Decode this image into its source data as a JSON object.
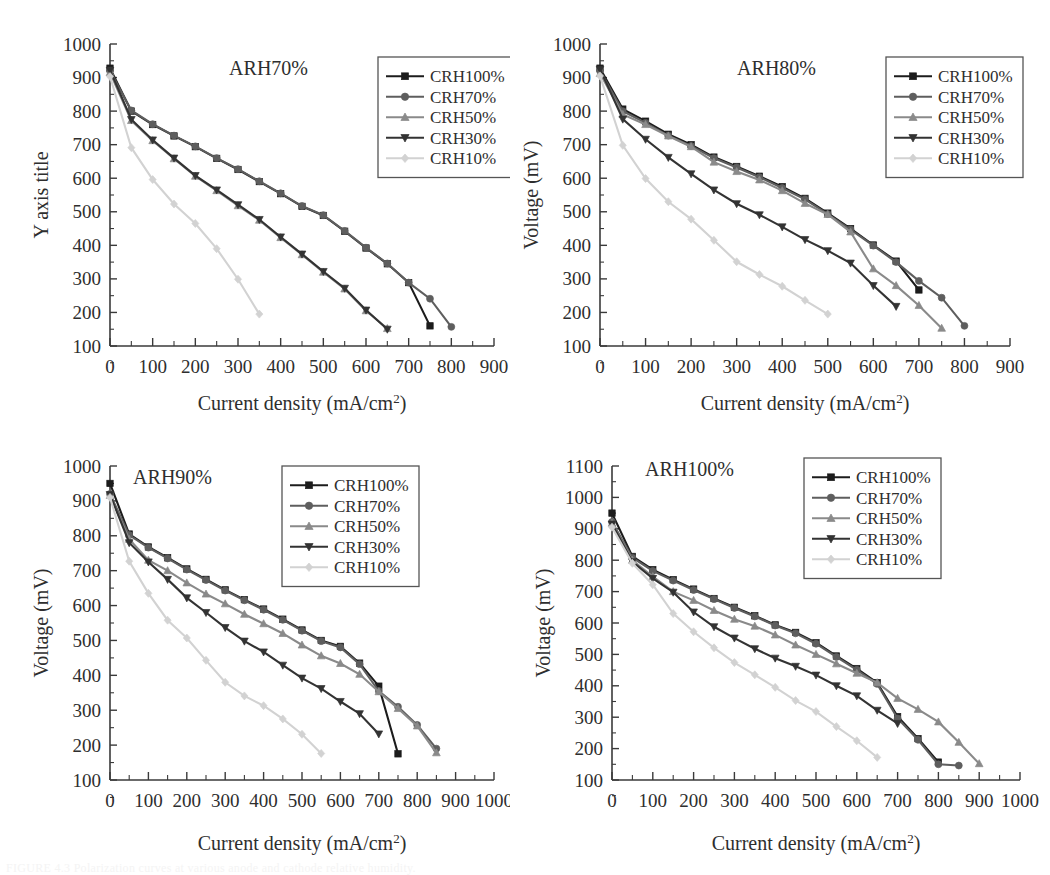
{
  "figure": {
    "panel_count": 4,
    "series_names": [
      "CRH100%",
      "CRH70%",
      "CRH50%",
      "CRH30%",
      "CRH10%"
    ],
    "series_colors": [
      "#1c1c1c",
      "#5e5e5e",
      "#8a8a8a",
      "#333333",
      "#d2d2d2"
    ],
    "series_markers": [
      "square",
      "circle",
      "triangle-up",
      "triangle-down",
      "diamond"
    ],
    "xlabel": "Current density (mA/cm",
    "xlabel_sup": "2",
    "xlabel_tail": ")",
    "caption": "FIGURE 4.3  Polarization curves at various anode and cathode relative humidity."
  },
  "chart_data": [
    {
      "id": "arh70",
      "type": "line",
      "title": "ARH70%",
      "xlabel": "Current density (mA/cm2)",
      "ylabel": "Y axis title",
      "xlim": [
        0,
        900
      ],
      "ylim": [
        100,
        1000
      ],
      "xticks": [
        0,
        100,
        200,
        300,
        400,
        500,
        600,
        700,
        800,
        900
      ],
      "yticks": [
        100,
        200,
        300,
        400,
        500,
        600,
        700,
        800,
        900,
        1000
      ],
      "grid": false,
      "legend_position": "top-right",
      "series": [
        {
          "name": "CRH100%",
          "x": [
            0,
            50,
            100,
            150,
            200,
            250,
            300,
            350,
            400,
            450,
            500,
            550,
            600,
            650,
            700,
            750
          ],
          "y": [
            928,
            800,
            760,
            726,
            694,
            659,
            626,
            590,
            554,
            516,
            489,
            442,
            392,
            345,
            289,
            160
          ]
        },
        {
          "name": "CRH70%",
          "x": [
            0,
            50,
            100,
            150,
            200,
            250,
            300,
            350,
            400,
            450,
            500,
            550,
            600,
            650,
            700,
            750,
            800
          ],
          "y": [
            920,
            802,
            761,
            727,
            695,
            660,
            627,
            591,
            555,
            517,
            490,
            443,
            393,
            346,
            289,
            241,
            157
          ]
        },
        {
          "name": "CRH50%",
          "x": [
            0,
            50,
            100,
            150,
            200,
            250,
            300,
            350,
            400,
            450,
            500,
            550,
            600,
            650
          ],
          "y": [
            915,
            772,
            712,
            658,
            606,
            563,
            518,
            475,
            423,
            372,
            320,
            270,
            205,
            152
          ]
        },
        {
          "name": "CRH30%",
          "x": [
            0,
            50,
            100,
            150,
            200,
            250,
            300,
            350,
            400,
            450,
            500,
            550,
            600,
            650
          ],
          "y": [
            922,
            775,
            714,
            660,
            608,
            565,
            521,
            477,
            425,
            374,
            322,
            272,
            207,
            150
          ]
        },
        {
          "name": "CRH10%",
          "x": [
            0,
            50,
            100,
            150,
            200,
            250,
            300,
            350
          ],
          "y": [
            903,
            691,
            596,
            523,
            465,
            390,
            299,
            195
          ]
        }
      ]
    },
    {
      "id": "arh80",
      "type": "line",
      "title": "ARH80%",
      "xlabel": "Current density (mA/cm2)",
      "ylabel": "Voltage (mV)",
      "xlim": [
        0,
        900
      ],
      "ylim": [
        100,
        1000
      ],
      "xticks": [
        0,
        100,
        200,
        300,
        400,
        500,
        600,
        700,
        800,
        900
      ],
      "yticks": [
        100,
        200,
        300,
        400,
        500,
        600,
        700,
        800,
        900,
        1000
      ],
      "grid": false,
      "legend_position": "top-right",
      "series": [
        {
          "name": "CRH100%",
          "x": [
            0,
            50,
            100,
            150,
            200,
            250,
            300,
            350,
            400,
            450,
            500,
            550,
            600,
            650,
            700
          ],
          "y": [
            928,
            806,
            770,
            731,
            700,
            663,
            635,
            606,
            575,
            540,
            496,
            450,
            401,
            353,
            267
          ]
        },
        {
          "name": "CRH70%",
          "x": [
            0,
            50,
            100,
            150,
            200,
            250,
            300,
            350,
            400,
            450,
            500,
            550,
            600,
            650,
            700,
            750,
            800
          ],
          "y": [
            920,
            800,
            765,
            727,
            696,
            660,
            632,
            603,
            571,
            537,
            493,
            447,
            399,
            350,
            294,
            244,
            160
          ]
        },
        {
          "name": "CRH50%",
          "x": [
            0,
            50,
            100,
            150,
            200,
            250,
            300,
            350,
            400,
            450,
            500,
            550,
            600,
            650,
            700,
            750
          ],
          "y": [
            912,
            790,
            760,
            726,
            694,
            648,
            620,
            595,
            563,
            525,
            492,
            440,
            330,
            280,
            221,
            153
          ]
        },
        {
          "name": "CRH30%",
          "x": [
            0,
            50,
            100,
            150,
            200,
            250,
            300,
            350,
            400,
            450,
            500,
            550,
            600,
            650
          ],
          "y": [
            925,
            776,
            716,
            662,
            613,
            565,
            524,
            491,
            455,
            417,
            384,
            347,
            280,
            218
          ]
        },
        {
          "name": "CRH10%",
          "x": [
            0,
            50,
            100,
            150,
            200,
            250,
            300,
            350,
            400,
            450,
            500
          ],
          "y": [
            905,
            698,
            599,
            530,
            478,
            415,
            351,
            313,
            278,
            236,
            195
          ]
        }
      ]
    },
    {
      "id": "arh90",
      "type": "line",
      "title": "ARH90%",
      "xlabel": "Current density (mA/cm2)",
      "ylabel": "Voltage (mV)",
      "xlim": [
        0,
        1000
      ],
      "ylim": [
        100,
        1000
      ],
      "xticks": [
        0,
        100,
        200,
        300,
        400,
        500,
        600,
        700,
        800,
        900,
        1000
      ],
      "yticks": [
        100,
        200,
        300,
        400,
        500,
        600,
        700,
        800,
        900,
        1000
      ],
      "grid": false,
      "legend_position": "top-right",
      "series": [
        {
          "name": "CRH100%",
          "x": [
            0,
            50,
            100,
            150,
            200,
            250,
            300,
            350,
            400,
            450,
            500,
            550,
            600,
            650,
            700,
            750
          ],
          "y": [
            950,
            805,
            768,
            737,
            705,
            675,
            645,
            617,
            590,
            561,
            530,
            500,
            483,
            435,
            369,
            175
          ]
        },
        {
          "name": "CRH70%",
          "x": [
            0,
            50,
            100,
            150,
            200,
            250,
            300,
            350,
            400,
            450,
            500,
            550,
            600,
            650,
            700,
            750,
            800,
            850
          ],
          "y": [
            920,
            802,
            766,
            735,
            703,
            673,
            643,
            615,
            588,
            559,
            528,
            498,
            480,
            432,
            355,
            310,
            258,
            190
          ]
        },
        {
          "name": "CRH50%",
          "x": [
            0,
            50,
            100,
            150,
            200,
            250,
            300,
            350,
            400,
            450,
            500,
            550,
            600,
            650,
            700,
            750,
            800,
            850
          ],
          "y": [
            916,
            790,
            730,
            700,
            665,
            633,
            605,
            575,
            548,
            520,
            487,
            456,
            434,
            403,
            353,
            305,
            255,
            178
          ]
        },
        {
          "name": "CRH30%",
          "x": [
            0,
            50,
            100,
            150,
            200,
            250,
            300,
            350,
            400,
            450,
            500,
            550,
            600,
            650,
            700
          ],
          "y": [
            918,
            780,
            725,
            675,
            622,
            580,
            537,
            498,
            467,
            429,
            392,
            362,
            325,
            290,
            232
          ]
        },
        {
          "name": "CRH10%",
          "x": [
            0,
            50,
            100,
            150,
            200,
            250,
            300,
            350,
            400,
            450,
            500,
            550
          ],
          "y": [
            910,
            727,
            635,
            558,
            507,
            443,
            380,
            341,
            313,
            275,
            231,
            176
          ]
        }
      ]
    },
    {
      "id": "arh100",
      "type": "line",
      "title": "ARH100%",
      "xlabel": "Current density (mA/cm2)",
      "ylabel": "Voltage (mV)",
      "xlim": [
        0,
        1000
      ],
      "ylim": [
        100,
        1100
      ],
      "xticks": [
        0,
        100,
        200,
        300,
        400,
        500,
        600,
        700,
        800,
        900,
        1000
      ],
      "yticks": [
        100,
        200,
        300,
        400,
        500,
        600,
        700,
        800,
        900,
        1000,
        1100
      ],
      "grid": false,
      "legend_position": "top-right",
      "series": [
        {
          "name": "CRH100%",
          "x": [
            0,
            50,
            100,
            150,
            200,
            250,
            300,
            350,
            400,
            450,
            500,
            550,
            600,
            650,
            700,
            750,
            800
          ],
          "y": [
            950,
            812,
            770,
            738,
            708,
            678,
            650,
            623,
            594,
            570,
            537,
            495,
            455,
            410,
            302,
            232,
            157
          ]
        },
        {
          "name": "CRH70%",
          "x": [
            0,
            50,
            100,
            150,
            200,
            250,
            300,
            350,
            400,
            450,
            500,
            550,
            600,
            650,
            700,
            750,
            800,
            850
          ],
          "y": [
            922,
            808,
            766,
            735,
            705,
            676,
            648,
            621,
            592,
            567,
            534,
            492,
            451,
            406,
            296,
            228,
            150,
            146
          ]
        },
        {
          "name": "CRH50%",
          "x": [
            0,
            50,
            100,
            150,
            200,
            250,
            300,
            350,
            400,
            450,
            500,
            550,
            600,
            650,
            700,
            750,
            800,
            850,
            900
          ],
          "y": [
            918,
            800,
            748,
            700,
            672,
            640,
            612,
            590,
            562,
            530,
            500,
            470,
            440,
            410,
            360,
            325,
            285,
            220,
            152
          ]
        },
        {
          "name": "CRH30%",
          "x": [
            0,
            50,
            100,
            150,
            200,
            250,
            300,
            350,
            400,
            450,
            500,
            550,
            600,
            650,
            700
          ],
          "y": [
            915,
            795,
            742,
            698,
            635,
            588,
            552,
            518,
            488,
            462,
            434,
            400,
            368,
            322,
            280
          ]
        },
        {
          "name": "CRH10%",
          "x": [
            0,
            50,
            100,
            150,
            200,
            250,
            300,
            350,
            400,
            450,
            500,
            550,
            600,
            650
          ],
          "y": [
            905,
            790,
            722,
            630,
            572,
            521,
            474,
            435,
            395,
            353,
            318,
            270,
            225,
            172
          ]
        }
      ]
    }
  ]
}
